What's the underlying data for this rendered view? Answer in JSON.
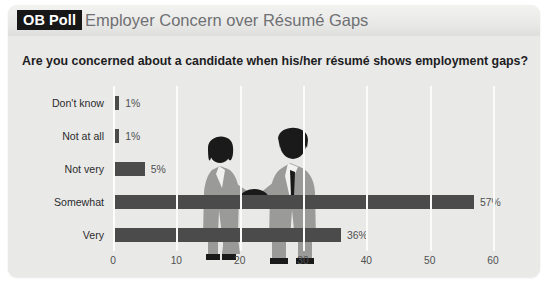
{
  "header": {
    "badge": "OB Poll",
    "title": "Employer Concern over Résumé Gaps"
  },
  "question": "Are you concerned about a candidate when his/her résumé shows employment gaps?",
  "colors": {
    "panel_background": "#e9e9e7",
    "header_background": "#eaeae8",
    "badge_background": "#171717",
    "badge_text": "#ffffff",
    "title_text": "#6f7073",
    "bar": "#4b4b4c",
    "gridline": "#fbfbfa",
    "axis_text": "#4f5052",
    "question_text": "#1d1d1f",
    "silhouette_dark": "#1a1a1a",
    "silhouette_mid": "#9a9a98"
  },
  "artwork": {
    "name": "handshake-silhouette",
    "description": "Two business people shaking hands"
  },
  "chart_data": {
    "type": "bar",
    "orientation": "horizontal",
    "title": "Employer Concern over Résumé Gaps",
    "subtitle": "Are you concerned about a candidate when his/her résumé shows employment gaps?",
    "categories": [
      "Don't know",
      "Not at all",
      "Not very",
      "Somewhat",
      "Very"
    ],
    "values": [
      1,
      1,
      5,
      57,
      36
    ],
    "value_labels": [
      "1%",
      "1%",
      "5%",
      "57%",
      "36%"
    ],
    "xlabel": "",
    "ylabel": "",
    "xlim": [
      0,
      60
    ],
    "xticks": [
      0,
      10,
      20,
      30,
      40,
      50,
      60
    ],
    "xtick_labels": [
      "0",
      "10",
      "20",
      "30",
      "40",
      "50",
      "60"
    ],
    "grid": true,
    "legend": false,
    "units": "percent"
  }
}
